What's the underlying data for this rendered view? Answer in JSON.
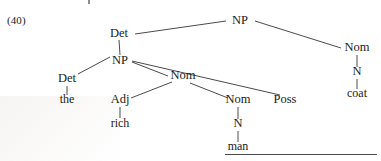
{
  "figure": {
    "example_number": "(40)",
    "ink_color": "#1b1b1b",
    "line_color": "#2a2a2a",
    "background_color": "#ffffff",
    "rule_color": "#4a4a4a"
  },
  "tree": {
    "type": "constituency-tree",
    "sentence": "the rich man's coat",
    "nodes": [
      {
        "id": "np-root",
        "label": "NP",
        "x": 240,
        "y": 24,
        "kind": "nonterminal"
      },
      {
        "id": "det-upper",
        "label": "Det",
        "x": 119,
        "y": 37,
        "kind": "nonterminal"
      },
      {
        "id": "nom-right",
        "label": "Nom",
        "x": 357,
        "y": 51,
        "kind": "nonterminal"
      },
      {
        "id": "n-coat",
        "label": "N",
        "x": 357,
        "y": 75,
        "kind": "nonterminal"
      },
      {
        "id": "coat",
        "label": "coat",
        "x": 357,
        "y": 97,
        "kind": "terminal"
      },
      {
        "id": "np-inner",
        "label": "NP",
        "x": 120,
        "y": 64,
        "kind": "nonterminal"
      },
      {
        "id": "det-lower",
        "label": "Det",
        "x": 67,
        "y": 82,
        "kind": "nonterminal"
      },
      {
        "id": "the",
        "label": "the",
        "x": 67,
        "y": 103,
        "kind": "terminal"
      },
      {
        "id": "nom-mid",
        "label": "Nom",
        "x": 183,
        "y": 79,
        "kind": "nonterminal"
      },
      {
        "id": "adj",
        "label": "Adj",
        "x": 120,
        "y": 103,
        "kind": "nonterminal"
      },
      {
        "id": "rich",
        "label": "rich",
        "x": 120,
        "y": 127,
        "kind": "terminal"
      },
      {
        "id": "nom-low",
        "label": "Nom",
        "x": 238,
        "y": 103,
        "kind": "nonterminal"
      },
      {
        "id": "n-man",
        "label": "N",
        "x": 238,
        "y": 127,
        "kind": "nonterminal"
      },
      {
        "id": "man",
        "label": "man",
        "x": 238,
        "y": 150,
        "kind": "terminal"
      },
      {
        "id": "poss",
        "label": "Poss",
        "x": 285,
        "y": 103,
        "kind": "nonterminal"
      }
    ],
    "edges": [
      {
        "from": "np-root",
        "to": "det-upper",
        "x1": 226,
        "y1": 21,
        "x2": 135,
        "y2": 34
      },
      {
        "from": "np-root",
        "to": "nom-right",
        "x1": 255,
        "y1": 21,
        "x2": 341,
        "y2": 48
      },
      {
        "from": "det-upper",
        "to": "np-inner",
        "x1": 119,
        "y1": 40,
        "x2": 120,
        "y2": 55
      },
      {
        "from": "nom-right",
        "to": "n-coat",
        "x1": 357,
        "y1": 55,
        "x2": 357,
        "y2": 67
      },
      {
        "from": "n-coat",
        "to": "coat",
        "x1": 357,
        "y1": 79,
        "x2": 357,
        "y2": 89
      },
      {
        "from": "np-inner",
        "to": "det-lower",
        "x1": 110,
        "y1": 57,
        "x2": 78,
        "y2": 74
      },
      {
        "from": "det-lower",
        "to": "the",
        "x1": 67,
        "y1": 86,
        "x2": 67,
        "y2": 95
      },
      {
        "from": "np-inner",
        "to": "nom-mid",
        "x1": 132,
        "y1": 62,
        "x2": 168,
        "y2": 76
      },
      {
        "from": "np-inner",
        "to": "poss",
        "x1": 132,
        "y1": 61,
        "x2": 280,
        "y2": 95
      },
      {
        "from": "nom-mid",
        "to": "adj",
        "x1": 172,
        "y1": 82,
        "x2": 131,
        "y2": 98
      },
      {
        "from": "adj",
        "to": "rich",
        "x1": 120,
        "y1": 107,
        "x2": 120,
        "y2": 118
      },
      {
        "from": "nom-mid",
        "to": "nom-low",
        "x1": 190,
        "y1": 83,
        "x2": 228,
        "y2": 98
      },
      {
        "from": "nom-low",
        "to": "n-man",
        "x1": 238,
        "y1": 107,
        "x2": 238,
        "y2": 119
      },
      {
        "from": "n-man",
        "to": "man",
        "x1": 238,
        "y1": 131,
        "x2": 238,
        "y2": 142
      }
    ]
  },
  "footer": {
    "rule_present": true
  }
}
